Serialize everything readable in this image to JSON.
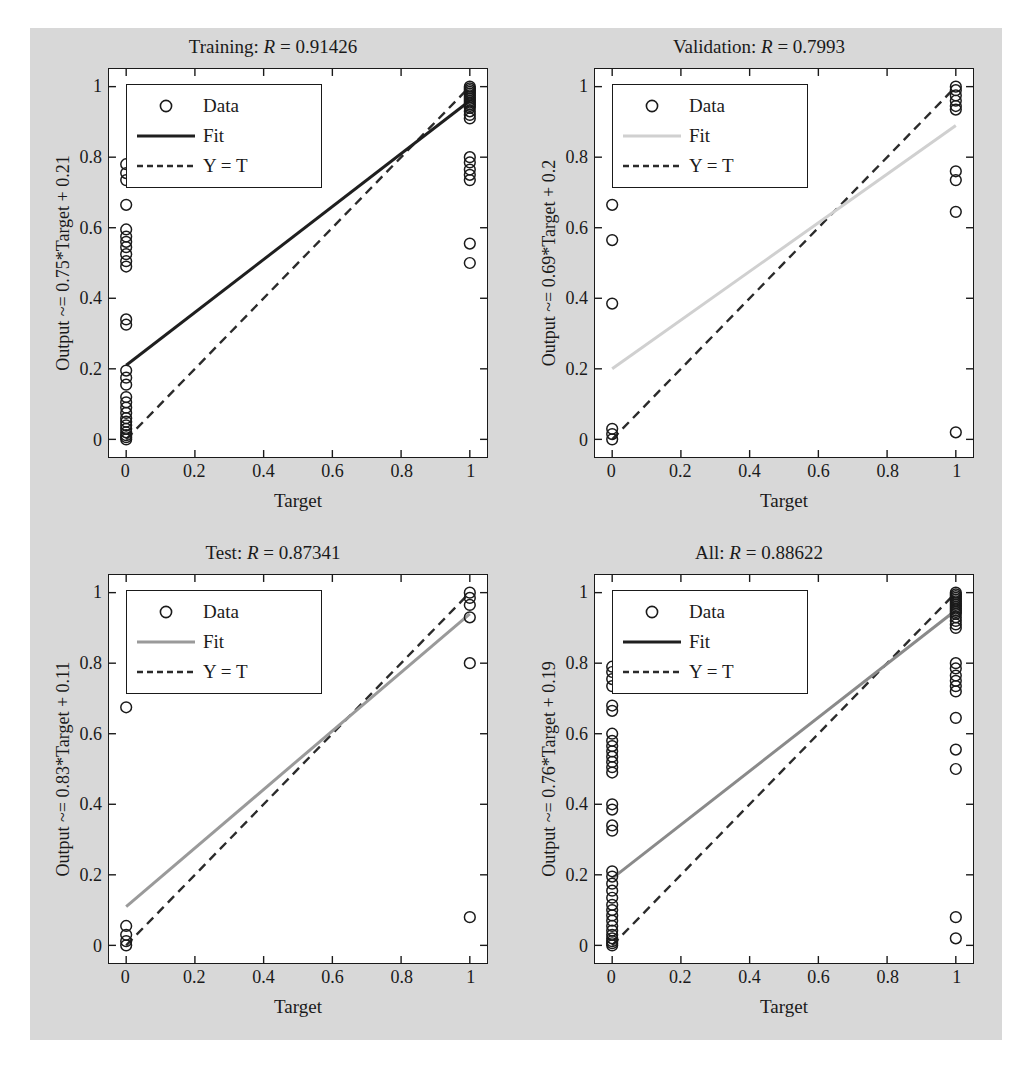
{
  "figure": {
    "background_color": "#d8d8d8",
    "axes_background_color": "#ffffff",
    "axis_color": "#1a1a1a"
  },
  "common": {
    "xlabel": "Target",
    "xticks": [
      "0",
      "0.2",
      "0.4",
      "0.6",
      "0.8",
      "1"
    ],
    "yticks": [
      "0",
      "0.2",
      "0.4",
      "0.6",
      "0.8",
      "1"
    ],
    "legend": {
      "data_label": "Data",
      "fit_label": "Fit",
      "identity_label": "Y = T",
      "marker_icon": "circle-marker-icon",
      "fit_icon": "solid-line-icon",
      "identity_icon": "dashed-line-icon"
    }
  },
  "chart_data": [
    {
      "type": "scatter",
      "panel": "training",
      "title_prefix": "Training: ",
      "title_r_symbol": "R",
      "title_r_value": " = 0.91426",
      "title": "Training: R = 0.91426",
      "r_value": 0.91426,
      "ylabel": "Output ~= 0.75*Target + 0.21",
      "xlabel": "Target",
      "slope": 0.75,
      "intercept": 0.21,
      "xlim": [
        -0.05,
        1.05
      ],
      "ylim": [
        -0.05,
        1.05
      ],
      "grid": false,
      "legend_position": "top-left",
      "fit_color": "#1f1f1f",
      "identity_color": "#2b2b2b",
      "marker_color": "#1a1a1a",
      "points": [
        {
          "x": 0,
          "y": 0.78
        },
        {
          "x": 0,
          "y": 0.755
        },
        {
          "x": 0,
          "y": 0.735
        },
        {
          "x": 0,
          "y": 0.665
        },
        {
          "x": 0,
          "y": 0.595
        },
        {
          "x": 0,
          "y": 0.575
        },
        {
          "x": 0,
          "y": 0.56
        },
        {
          "x": 0,
          "y": 0.545
        },
        {
          "x": 0,
          "y": 0.525
        },
        {
          "x": 0,
          "y": 0.505
        },
        {
          "x": 0,
          "y": 0.49
        },
        {
          "x": 0,
          "y": 0.34
        },
        {
          "x": 0,
          "y": 0.325
        },
        {
          "x": 0,
          "y": 0.195
        },
        {
          "x": 0,
          "y": 0.175
        },
        {
          "x": 0,
          "y": 0.155
        },
        {
          "x": 0,
          "y": 0.12
        },
        {
          "x": 0,
          "y": 0.105
        },
        {
          "x": 0,
          "y": 0.09
        },
        {
          "x": 0,
          "y": 0.075
        },
        {
          "x": 0,
          "y": 0.06
        },
        {
          "x": 0,
          "y": 0.05
        },
        {
          "x": 0,
          "y": 0.04
        },
        {
          "x": 0,
          "y": 0.03
        },
        {
          "x": 0,
          "y": 0.02
        },
        {
          "x": 0,
          "y": 0.012
        },
        {
          "x": 0,
          "y": 0.006
        },
        {
          "x": 0,
          "y": 0.0
        },
        {
          "x": 1,
          "y": 1.0
        },
        {
          "x": 1,
          "y": 0.995
        },
        {
          "x": 1,
          "y": 0.99
        },
        {
          "x": 1,
          "y": 0.985
        },
        {
          "x": 1,
          "y": 0.98
        },
        {
          "x": 1,
          "y": 0.975
        },
        {
          "x": 1,
          "y": 0.97
        },
        {
          "x": 1,
          "y": 0.965
        },
        {
          "x": 1,
          "y": 0.96
        },
        {
          "x": 1,
          "y": 0.955
        },
        {
          "x": 1,
          "y": 0.95
        },
        {
          "x": 1,
          "y": 0.945
        },
        {
          "x": 1,
          "y": 0.94
        },
        {
          "x": 1,
          "y": 0.93
        },
        {
          "x": 1,
          "y": 0.92
        },
        {
          "x": 1,
          "y": 0.91
        },
        {
          "x": 1,
          "y": 0.8
        },
        {
          "x": 1,
          "y": 0.785
        },
        {
          "x": 1,
          "y": 0.765
        },
        {
          "x": 1,
          "y": 0.75
        },
        {
          "x": 1,
          "y": 0.735
        },
        {
          "x": 1,
          "y": 0.555
        },
        {
          "x": 1,
          "y": 0.5
        }
      ]
    },
    {
      "type": "scatter",
      "panel": "validation",
      "title_prefix": "Validation: ",
      "title_r_symbol": "R",
      "title_r_value": " = 0.7993",
      "title": "Validation: R = 0.7993",
      "r_value": 0.7993,
      "ylabel": "Output ~= 0.69*Target + 0.2",
      "xlabel": "Target",
      "slope": 0.69,
      "intercept": 0.2,
      "xlim": [
        -0.05,
        1.05
      ],
      "ylim": [
        -0.05,
        1.05
      ],
      "grid": false,
      "legend_position": "top-left",
      "fit_color": "#d0d0d0",
      "identity_color": "#2b2b2b",
      "marker_color": "#1a1a1a",
      "points": [
        {
          "x": 0,
          "y": 0.665
        },
        {
          "x": 0,
          "y": 0.565
        },
        {
          "x": 0,
          "y": 0.385
        },
        {
          "x": 0,
          "y": 0.03
        },
        {
          "x": 0,
          "y": 0.015
        },
        {
          "x": 0,
          "y": 0.0
        },
        {
          "x": 1,
          "y": 1.0
        },
        {
          "x": 1,
          "y": 0.99
        },
        {
          "x": 1,
          "y": 0.975
        },
        {
          "x": 1,
          "y": 0.96
        },
        {
          "x": 1,
          "y": 0.945
        },
        {
          "x": 1,
          "y": 0.935
        },
        {
          "x": 1,
          "y": 0.76
        },
        {
          "x": 1,
          "y": 0.735
        },
        {
          "x": 1,
          "y": 0.645
        },
        {
          "x": 1,
          "y": 0.02
        }
      ]
    },
    {
      "type": "scatter",
      "panel": "test",
      "title_prefix": "Test: ",
      "title_r_symbol": "R",
      "title_r_value": " = 0.87341",
      "title": "Test: R = 0.87341",
      "r_value": 0.87341,
      "ylabel": "Output ~= 0.83*Target + 0.11",
      "xlabel": "Target",
      "slope": 0.83,
      "intercept": 0.11,
      "xlim": [
        -0.05,
        1.05
      ],
      "ylim": [
        -0.05,
        1.05
      ],
      "grid": false,
      "legend_position": "top-left",
      "fit_color": "#9a9a9a",
      "identity_color": "#2b2b2b",
      "marker_color": "#1a1a1a",
      "points": [
        {
          "x": 0,
          "y": 0.675
        },
        {
          "x": 0,
          "y": 0.055
        },
        {
          "x": 0,
          "y": 0.03
        },
        {
          "x": 0,
          "y": 0.012
        },
        {
          "x": 0,
          "y": 0.0
        },
        {
          "x": 1,
          "y": 1.0
        },
        {
          "x": 1,
          "y": 0.985
        },
        {
          "x": 1,
          "y": 0.965
        },
        {
          "x": 1,
          "y": 0.93
        },
        {
          "x": 1,
          "y": 0.8
        },
        {
          "x": 1,
          "y": 0.08
        }
      ]
    },
    {
      "type": "scatter",
      "panel": "all",
      "title_prefix": "All: ",
      "title_r_symbol": "R",
      "title_r_value": " = 0.88622",
      "title": "All: R = 0.88622",
      "r_value": 0.88622,
      "ylabel": "Output ~= 0.76*Target + 0.19",
      "xlabel": "Target",
      "slope": 0.76,
      "intercept": 0.19,
      "xlim": [
        -0.05,
        1.05
      ],
      "ylim": [
        -0.05,
        1.05
      ],
      "grid": false,
      "legend_position": "top-left",
      "fit_color": "#8a8a8a",
      "identity_color": "#2b2b2b",
      "marker_color": "#1a1a1a",
      "points": [
        {
          "x": 0,
          "y": 0.79
        },
        {
          "x": 0,
          "y": 0.775
        },
        {
          "x": 0,
          "y": 0.755
        },
        {
          "x": 0,
          "y": 0.735
        },
        {
          "x": 0,
          "y": 0.68
        },
        {
          "x": 0,
          "y": 0.665
        },
        {
          "x": 0,
          "y": 0.6
        },
        {
          "x": 0,
          "y": 0.58
        },
        {
          "x": 0,
          "y": 0.565
        },
        {
          "x": 0,
          "y": 0.55
        },
        {
          "x": 0,
          "y": 0.535
        },
        {
          "x": 0,
          "y": 0.52
        },
        {
          "x": 0,
          "y": 0.505
        },
        {
          "x": 0,
          "y": 0.49
        },
        {
          "x": 0,
          "y": 0.4
        },
        {
          "x": 0,
          "y": 0.385
        },
        {
          "x": 0,
          "y": 0.34
        },
        {
          "x": 0,
          "y": 0.325
        },
        {
          "x": 0,
          "y": 0.21
        },
        {
          "x": 0,
          "y": 0.195
        },
        {
          "x": 0,
          "y": 0.175
        },
        {
          "x": 0,
          "y": 0.155
        },
        {
          "x": 0,
          "y": 0.135
        },
        {
          "x": 0,
          "y": 0.115
        },
        {
          "x": 0,
          "y": 0.1
        },
        {
          "x": 0,
          "y": 0.085
        },
        {
          "x": 0,
          "y": 0.07
        },
        {
          "x": 0,
          "y": 0.055
        },
        {
          "x": 0,
          "y": 0.042
        },
        {
          "x": 0,
          "y": 0.03
        },
        {
          "x": 0,
          "y": 0.02
        },
        {
          "x": 0,
          "y": 0.012
        },
        {
          "x": 0,
          "y": 0.006
        },
        {
          "x": 0,
          "y": 0.0
        },
        {
          "x": 1,
          "y": 1.0
        },
        {
          "x": 1,
          "y": 0.995
        },
        {
          "x": 1,
          "y": 0.99
        },
        {
          "x": 1,
          "y": 0.985
        },
        {
          "x": 1,
          "y": 0.98
        },
        {
          "x": 1,
          "y": 0.975
        },
        {
          "x": 1,
          "y": 0.97
        },
        {
          "x": 1,
          "y": 0.965
        },
        {
          "x": 1,
          "y": 0.96
        },
        {
          "x": 1,
          "y": 0.955
        },
        {
          "x": 1,
          "y": 0.95
        },
        {
          "x": 1,
          "y": 0.945
        },
        {
          "x": 1,
          "y": 0.94
        },
        {
          "x": 1,
          "y": 0.93
        },
        {
          "x": 1,
          "y": 0.92
        },
        {
          "x": 1,
          "y": 0.91
        },
        {
          "x": 1,
          "y": 0.9
        },
        {
          "x": 1,
          "y": 0.8
        },
        {
          "x": 1,
          "y": 0.785
        },
        {
          "x": 1,
          "y": 0.765
        },
        {
          "x": 1,
          "y": 0.75
        },
        {
          "x": 1,
          "y": 0.735
        },
        {
          "x": 1,
          "y": 0.72
        },
        {
          "x": 1,
          "y": 0.645
        },
        {
          "x": 1,
          "y": 0.555
        },
        {
          "x": 1,
          "y": 0.5
        },
        {
          "x": 1,
          "y": 0.08
        },
        {
          "x": 1,
          "y": 0.02
        }
      ]
    }
  ]
}
